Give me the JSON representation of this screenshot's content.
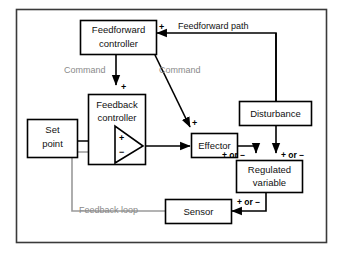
{
  "diagram": {
    "colors": {
      "line_black": "#000000",
      "line_gray": "#9a9a9a",
      "text_dark": "#111111",
      "text_gray": "#8a8a8a",
      "frame": "#3a3a3a",
      "background": "#ffffff"
    },
    "blocks": [
      {
        "id": "feedforward-controller",
        "line1": "Feedforward",
        "line2": "controller"
      },
      {
        "id": "set-point",
        "line1": "Set",
        "line2": "point"
      },
      {
        "id": "feedback-controller",
        "line1": "Feedback",
        "line2": "controller"
      },
      {
        "id": "effector",
        "line1": "Effector",
        "line2": ""
      },
      {
        "id": "disturbance",
        "line1": "Disturbance",
        "line2": ""
      },
      {
        "id": "regulated-variable",
        "line1": "Regulated",
        "line2": "variable"
      },
      {
        "id": "sensor",
        "line1": "Sensor",
        "line2": ""
      }
    ],
    "path_labels": [
      {
        "id": "feedforward-path",
        "text": "Feedforward path",
        "style": "dark"
      },
      {
        "id": "command-to-feedback",
        "text": "Command",
        "style": "gray"
      },
      {
        "id": "command-to-effector",
        "text": "Command",
        "style": "gray"
      },
      {
        "id": "feedback-loop",
        "text": "Feedback loop",
        "style": "gray"
      }
    ],
    "sign_labels": [
      {
        "id": "sign-feedforward-input",
        "text": "+"
      },
      {
        "id": "sign-command-into-feedback",
        "text": "+"
      },
      {
        "id": "sign-command-into-effector",
        "text": "+"
      },
      {
        "id": "sign-summing-plus",
        "text": "+"
      },
      {
        "id": "sign-summing-minus",
        "text": "−"
      },
      {
        "id": "sign-effector-output",
        "text": "+ or −"
      },
      {
        "id": "sign-disturbance-output",
        "text": "+ or −"
      },
      {
        "id": "sign-sensor-input",
        "text": "+ or −"
      }
    ]
  }
}
